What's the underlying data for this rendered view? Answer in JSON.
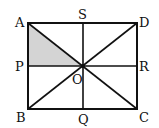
{
  "diagram": {
    "type": "geometry-figure",
    "points": {
      "A": {
        "label": "A",
        "x": 28,
        "y": 23
      },
      "D": {
        "label": "D",
        "x": 137,
        "y": 23
      },
      "B": {
        "label": "B",
        "x": 28,
        "y": 109
      },
      "C": {
        "label": "C",
        "x": 137,
        "y": 109
      },
      "S": {
        "label": "S",
        "x": 83,
        "y": 23
      },
      "Q": {
        "label": "Q",
        "x": 83,
        "y": 109
      },
      "P": {
        "label": "P",
        "x": 28,
        "y": 66
      },
      "R": {
        "label": "R",
        "x": 137,
        "y": 66
      },
      "O": {
        "label": "O",
        "x": 83,
        "y": 66
      }
    },
    "shaded_region": [
      "A",
      "P",
      "O"
    ],
    "colors": {
      "stroke": "#111111",
      "shade": "#d4d4d4"
    }
  }
}
